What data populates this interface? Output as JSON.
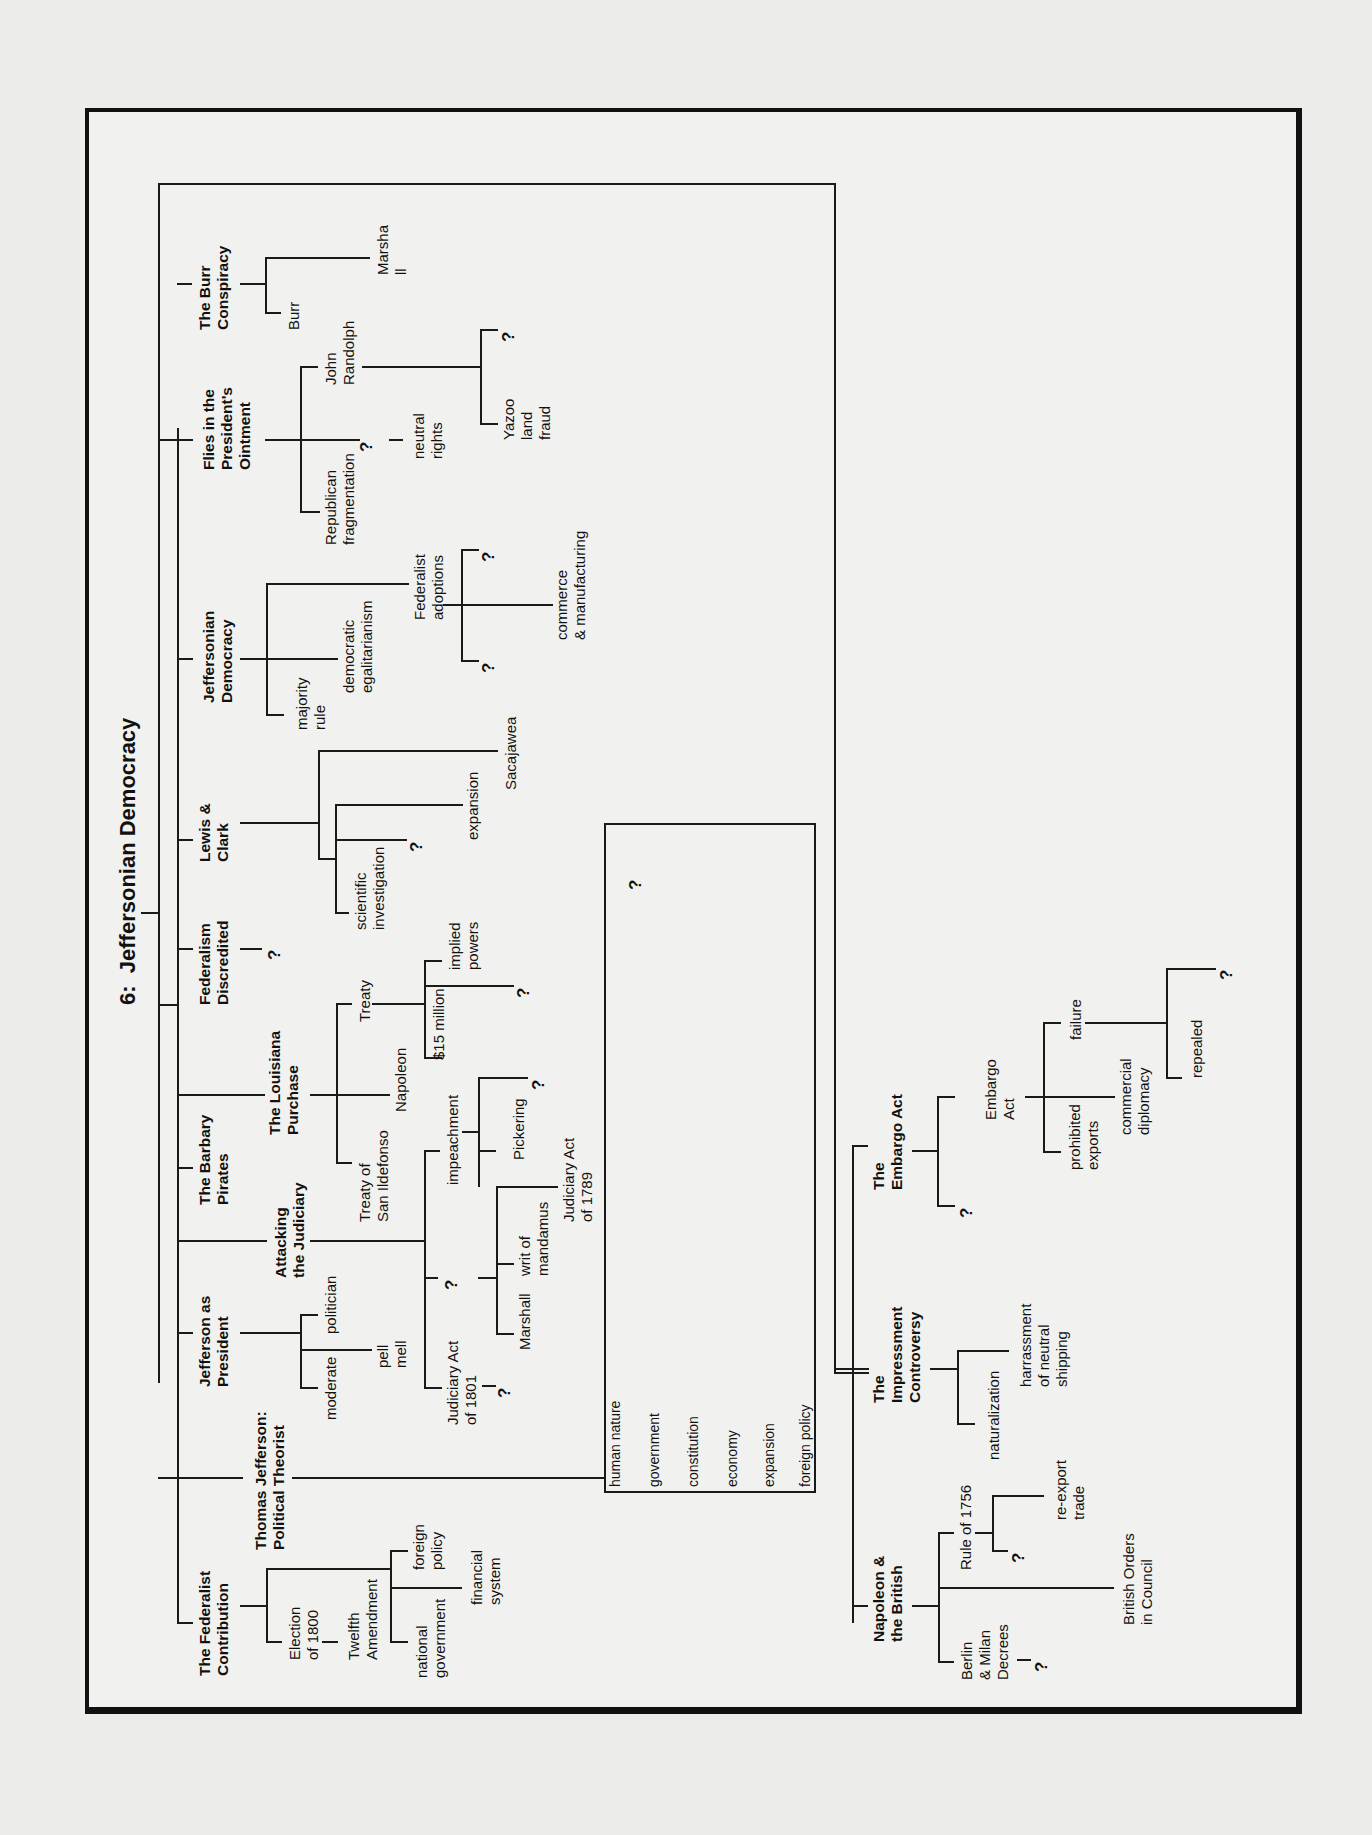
{
  "title": "6:  Jeffersonian Democracy",
  "topics": {
    "burr": {
      "label": "The Burr\nConspiracy",
      "children": [
        "Burr",
        "Marsha\nll"
      ]
    },
    "flies": {
      "label": "Flies in the\nPresident's\nOintment",
      "children": [
        "Republican\nfragmentation",
        "?",
        "neutral\nrights",
        "John\nRandolph",
        "Yazoo\nland\nfraud",
        "?"
      ]
    },
    "jeffdem": {
      "label": "Jeffersonian\nDemocracy",
      "children": [
        "majority\nrule",
        "democratic\negalitarianism",
        "Federalist\nadoptions",
        "?",
        "commerce\n& manufacturing",
        "?"
      ]
    },
    "lewis": {
      "label": "Lewis &\nClark",
      "children": [
        "scientific\ninvestigation",
        "?",
        "expansion",
        "Sacajawea"
      ]
    },
    "fedDisc": {
      "label": "Federalism\nDiscredited",
      "children": [
        "?"
      ]
    },
    "louisiana": {
      "label": "The Louisiana\nPurchase",
      "children": [
        "Treaty of\nSan Ildefonso",
        "Napoleon",
        "Treaty",
        "$15 million",
        "?",
        "implied\npowers"
      ]
    },
    "barbary": {
      "label": "The Barbary\nPirates"
    },
    "judiciary": {
      "label": "Attacking\nthe Judiciary",
      "children": [
        "Judiciary Act\nof 1801",
        "?",
        "?",
        "Marshall",
        "writ of\nmandamus",
        "Judiciary Act\nof 1789",
        "impeachment",
        "Pickering",
        "?"
      ]
    },
    "president": {
      "label": "Jefferson as\nPresident",
      "children": [
        "moderate",
        "pell\nmell",
        "politician"
      ]
    },
    "theorist": {
      "label": "Thomas Jefferson:\nPolitical Theorist",
      "box_items": [
        "human nature",
        "government",
        "constitution",
        "economy",
        "expansion",
        "foreign policy"
      ],
      "box_question": "?"
    },
    "federalist": {
      "label": "The Federalist\nContribution",
      "children": [
        "Election\nof 1800",
        "Twelfth\nAmendment",
        "national\ngovernment",
        "financial\nsystem",
        "foreign\npolicy"
      ]
    },
    "napoleon": {
      "label": "Napoleon &\nthe British",
      "children": [
        "Berlin\n& Milan\nDecrees",
        "?",
        "British Orders\nin Council",
        "Rule of 1756",
        "?",
        "re-export\ntrade"
      ]
    },
    "impressment": {
      "label": "The\nImpressment\nControversy",
      "children": [
        "naturalization",
        "harrassment\nof neutral\nshipping"
      ]
    },
    "embargo": {
      "label": "The\nEmbargo Act",
      "children": [
        "?",
        "Embargo\nAct",
        "prohibited\nexports",
        "commercial\ndiplomacy",
        "failure",
        "repealed",
        "?"
      ]
    }
  }
}
